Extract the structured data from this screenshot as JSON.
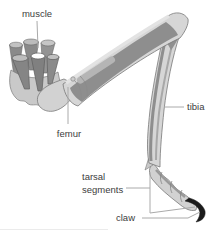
{
  "figure": {
    "type": "anatomical-diagram",
    "labels": {
      "muscle": "muscle",
      "femur": "femur",
      "tibia": "tibia",
      "tarsal_segments": {
        "line1": "tarsal",
        "line2": "segments"
      },
      "claw": "claw"
    },
    "colors": {
      "background": "#ffffff",
      "exoskeleton_light": "#d6d6d6",
      "exoskeleton_mid": "#b8b8b8",
      "muscle_dark": "#8e8e8e",
      "outline": "#787878",
      "claw": "#1b1b1b",
      "leader_line": "#aaaaaa",
      "label_text": "#3d3d3d"
    }
  }
}
